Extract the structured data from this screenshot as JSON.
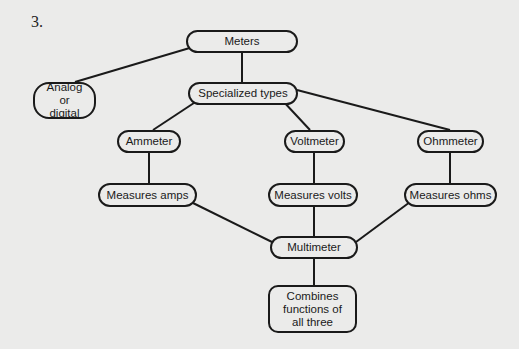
{
  "question_number": "3.",
  "nodes": {
    "meters": "Meters",
    "analog": "Analog or digital",
    "specialized": "Specialized types",
    "ammeter": "Ammeter",
    "voltmeter": "Voltmeter",
    "ohmmeter": "Ohmmeter",
    "amps": "Measures amps",
    "volts": "Measures volts",
    "ohms": "Measures ohms",
    "multimeter": "Multimeter",
    "combines": "Combines functions of all three"
  },
  "colors": {
    "background": "#ebebea",
    "stroke": "#1a1a1a"
  }
}
